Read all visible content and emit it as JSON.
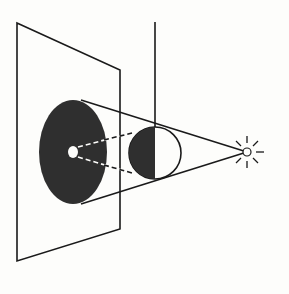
{
  "diagram": {
    "colors": {
      "background": "#fdfdfb",
      "ink": "#1a1a1a",
      "shadow": "#2f2f2f"
    },
    "elements": {
      "screen": "screen-plane",
      "shadow": "umbra-ellipse",
      "sphere": "half-lit-sphere",
      "support_rod": "vertical-rod",
      "light": "point-light-source"
    }
  }
}
